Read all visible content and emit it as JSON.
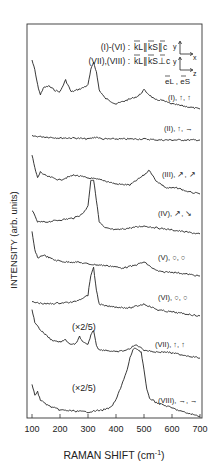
{
  "chart_data": {
    "type": "line",
    "title": "",
    "xlabel": "RAMAN SHIFT (cm⁻¹)",
    "ylabel": "INTENSITY (arb. units)",
    "xlim": [
      100,
      700
    ],
    "xticks": [
      100,
      200,
      300,
      400,
      500,
      600,
      700
    ],
    "grid": false,
    "legend": {
      "line1_prefix": "(I)-(VI) :",
      "line1_geom": "k̄L∥k̄S∥c̄",
      "line2_prefix": "(VII),(VIII) :",
      "line2_geom": "k̄L∥k̄S⊥c̄",
      "axes1": [
        "y",
        "x"
      ],
      "axes2": [
        "y",
        "z"
      ],
      "polarization_label": "ēL , ēS"
    },
    "series": [
      {
        "name": "(I), ↑, ↑",
        "scale": "",
        "baseline_y": 85,
        "x": [
          100,
          110,
          120,
          130,
          140,
          160,
          180,
          200,
          220,
          240,
          260,
          280,
          300,
          310,
          320,
          330,
          340,
          360,
          400,
          440,
          480,
          500,
          520,
          540,
          560,
          600,
          640,
          680,
          700
        ],
        "y": [
          60,
          70,
          85,
          95,
          88,
          86,
          90,
          92,
          80,
          92,
          90,
          88,
          85,
          70,
          62,
          72,
          90,
          98,
          104,
          100,
          96,
          90,
          95,
          100,
          100,
          104,
          106,
          108,
          109
        ]
      },
      {
        "name": "(II), ↑, →",
        "scale": "",
        "baseline_y": 138,
        "x": [
          100,
          150,
          200,
          250,
          300,
          330,
          350,
          400,
          450,
          500,
          550,
          600,
          650,
          700
        ],
        "y": [
          136,
          137,
          138,
          138,
          139,
          137,
          139,
          139,
          139,
          139,
          140,
          140,
          140,
          140
        ]
      },
      {
        "name": "(III), ↗, ↗",
        "scale": "",
        "baseline_y": 180,
        "x": [
          100,
          110,
          120,
          130,
          150,
          200,
          250,
          300,
          350,
          400,
          450,
          500,
          520,
          540,
          580,
          620,
          660,
          700
        ],
        "y": [
          155,
          168,
          178,
          172,
          176,
          180,
          175,
          178,
          180,
          184,
          185,
          175,
          170,
          180,
          188,
          188,
          192,
          194
        ]
      },
      {
        "name": "(IV), ↗, ↘",
        "scale": "",
        "baseline_y": 222,
        "x": [
          100,
          120,
          150,
          200,
          250,
          280,
          300,
          310,
          320,
          330,
          340,
          360,
          400,
          450,
          500,
          550,
          600,
          650,
          700
        ],
        "y": [
          210,
          222,
          222,
          220,
          218,
          214,
          206,
          180,
          180,
          200,
          222,
          228,
          230,
          228,
          226,
          228,
          230,
          232,
          234
        ]
      },
      {
        "name": "(V), ○, ○",
        "scale": "",
        "baseline_y": 258,
        "x": [
          100,
          110,
          120,
          140,
          180,
          220,
          260,
          300,
          340,
          380,
          420,
          460,
          500,
          540,
          560,
          600,
          650,
          700
        ],
        "y": [
          232,
          250,
          258,
          255,
          260,
          262,
          262,
          264,
          265,
          266,
          268,
          266,
          262,
          270,
          272,
          272,
          274,
          276
        ]
      },
      {
        "name": "(VI), ○, ○",
        "scale": "",
        "baseline_y": 304,
        "x": [
          100,
          150,
          200,
          250,
          280,
          300,
          310,
          320,
          330,
          340,
          360,
          400,
          450,
          500,
          550,
          600,
          650,
          700
        ],
        "y": [
          302,
          304,
          303,
          302,
          298,
          295,
          275,
          268,
          290,
          304,
          306,
          307,
          308,
          304,
          310,
          312,
          314,
          316
        ]
      },
      {
        "name": "(VII), ↑, ↑",
        "scale": "(×2/5)",
        "baseline_y": 340,
        "x": [
          100,
          110,
          130,
          150,
          170,
          200,
          220,
          240,
          260,
          270,
          280,
          300,
          310,
          320,
          330,
          340,
          360,
          400,
          440,
          470,
          480,
          500,
          540,
          580,
          620,
          660,
          700
        ],
        "y": [
          310,
          322,
          330,
          335,
          340,
          342,
          340,
          345,
          343,
          336,
          342,
          345,
          335,
          330,
          345,
          350,
          350,
          352,
          350,
          345,
          346,
          350,
          352,
          352,
          354,
          356,
          358
        ]
      },
      {
        "name": "(VIII), →, →",
        "scale": "(×2/5)",
        "baseline_y": 410,
        "x": [
          100,
          110,
          120,
          130,
          140,
          160,
          180,
          200,
          250,
          300,
          350,
          380,
          400,
          420,
          440,
          450,
          460,
          470,
          480,
          490,
          500,
          510,
          520,
          540,
          560,
          600,
          640,
          680,
          700
        ],
        "y": [
          385,
          395,
          392,
          400,
          402,
          406,
          408,
          410,
          411,
          412,
          410,
          408,
          400,
          385,
          370,
          358,
          350,
          348,
          350,
          352,
          370,
          390,
          398,
          402,
          404,
          408,
          412,
          415,
          416
        ]
      }
    ]
  },
  "axis": {
    "x_label_text": "RAMAN SHIFT (cm",
    "x_label_sup": "-1",
    "x_label_close": ")",
    "y_label": "INTENSITY (arb. units)",
    "ticks": [
      "100",
      "200",
      "300",
      "400",
      "500",
      "600",
      "700"
    ]
  },
  "legend": {
    "l1": "(I)-(VI) :",
    "l2": "(VII),(VIII) :",
    "g1": "kL∥kS∥c",
    "g2": "kL∥kS⊥c",
    "y": "y",
    "x": "x",
    "z": "z",
    "pol": "eL , eS"
  },
  "labels": [
    {
      "text": "(I), ↑, ↑",
      "x": 168,
      "y": 100
    },
    {
      "text": "(II), ↑, →",
      "x": 164,
      "y": 131
    },
    {
      "text": "(III), ↗, ↗",
      "x": 162,
      "y": 177
    },
    {
      "text": "(IV), ↗, ↘",
      "x": 158,
      "y": 216
    },
    {
      "text": "(V), ○, ○",
      "x": 158,
      "y": 260
    },
    {
      "text": "(VI), ○, ○",
      "x": 158,
      "y": 300
    },
    {
      "text": "(VII), ↑, ↑",
      "x": 155,
      "y": 347
    },
    {
      "text": "(VIII), →, →",
      "x": 158,
      "y": 403
    }
  ],
  "scale_notes": [
    {
      "text": "(×2/5)",
      "x": 72,
      "y": 330
    },
    {
      "text": "(×2/5)",
      "x": 72,
      "y": 391
    }
  ]
}
